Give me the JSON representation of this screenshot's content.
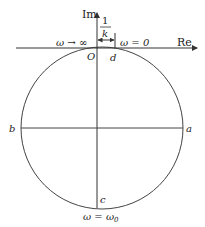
{
  "axes": {
    "x_label": "Re",
    "y_label": "Im",
    "origin_label": "O"
  },
  "points": {
    "a": "a",
    "b": "b",
    "c": "c",
    "d": "d"
  },
  "annotations": {
    "omega_infinity": "ω → ∞",
    "omega_zero": "ω = 0",
    "omega_omega0": "ω = ω",
    "omega0_subscript": "0",
    "gap_numerator": "1",
    "gap_denominator": "k"
  },
  "colors": {
    "line": "#333333",
    "text": "#222222"
  }
}
